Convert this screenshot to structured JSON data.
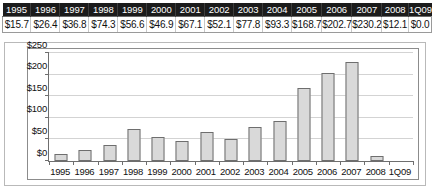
{
  "table": {
    "headers": [
      "1995",
      "1996",
      "1997",
      "1998",
      "1999",
      "2000",
      "2001",
      "2002",
      "2003",
      "2004",
      "2005",
      "2006",
      "2007",
      "2008",
      "1Q09"
    ],
    "values": [
      "$15.7",
      "$26.4",
      "$36.8",
      "$74.3",
      "$56.6",
      "$46.9",
      "$67.1",
      "$52.1",
      "$77.8",
      "$93.3",
      "$168.7",
      "$202.7",
      "$230.2",
      "$12.1",
      "$0.0"
    ]
  },
  "chart_data": {
    "type": "bar",
    "title": "",
    "subtitle": "",
    "xlabel": "",
    "ylabel": "",
    "categories": [
      "1995",
      "1996",
      "1997",
      "1998",
      "1999",
      "2000",
      "2001",
      "2002",
      "2003",
      "2004",
      "2005",
      "2006",
      "2007",
      "2008",
      "1Q09"
    ],
    "values": [
      15.7,
      26.4,
      36.8,
      74.3,
      56.6,
      46.9,
      67.1,
      52.1,
      77.8,
      93.3,
      168.7,
      202.7,
      230.2,
      12.1,
      0.0
    ],
    "ylim": [
      0,
      250
    ],
    "yticks": [
      0,
      50,
      100,
      150,
      200,
      250
    ],
    "ytick_labels": [
      "$0",
      "$50",
      "$100",
      "$150",
      "$200",
      "$250"
    ],
    "grid": true,
    "legend": "none",
    "series": [
      {
        "name": "Value",
        "values": [
          15.7,
          26.4,
          36.8,
          74.3,
          56.6,
          46.9,
          67.1,
          52.1,
          77.8,
          93.3,
          168.7,
          202.7,
          230.2,
          12.1,
          0.0
        ]
      }
    ]
  },
  "colors": {
    "bar_fill": "#d9d9d9",
    "bar_stroke": "#6e6e6e",
    "header_bg": "#1b1b1b",
    "header_text": "#ffffff",
    "grid": "#d3d3d3",
    "axis": "#6e6e6e"
  }
}
